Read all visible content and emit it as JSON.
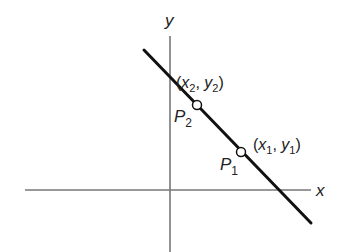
{
  "diagram": {
    "axes": {
      "x_label": "x",
      "y_label": "y",
      "axis_color": "#777777"
    },
    "line": {
      "color": "#111111",
      "start": [
        144,
        50
      ],
      "end": [
        311,
        223
      ]
    },
    "points": [
      {
        "name": "P",
        "name_sub": "2",
        "coord_label": {
          "open": "(",
          "x": "x",
          "x_sub": "2",
          "sep": ", ",
          "y": "y",
          "y_sub": "2",
          "close": ")"
        }
      },
      {
        "name": "P",
        "name_sub": "1",
        "coord_label": {
          "open": "(",
          "x": "x",
          "x_sub": "1",
          "sep": ", ",
          "y": "y",
          "y_sub": "1",
          "close": ")"
        }
      }
    ]
  }
}
